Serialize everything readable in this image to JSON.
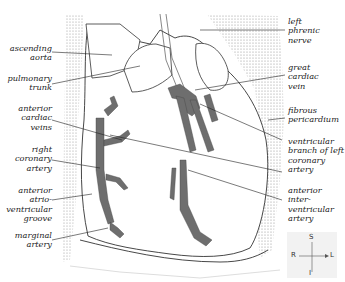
{
  "figure": {
    "labels_left": [
      {
        "id": "ascending-aorta",
        "text": "ascending\naorta",
        "x": 8,
        "y": 44
      },
      {
        "id": "pulmonary-trunk",
        "text": "pulmonary\ntrunk",
        "x": 8,
        "y": 74
      },
      {
        "id": "anterior-cardiac-veins",
        "text": "anterior\ncardiac\nveins",
        "x": 8,
        "y": 104
      },
      {
        "id": "right-coronary-artery",
        "text": "right\ncoronary\nartery",
        "x": 8,
        "y": 145
      },
      {
        "id": "anterior-atrioventricular-groove",
        "text": "anterior\natrio-\nventricular\ngroove",
        "x": 8,
        "y": 186
      },
      {
        "id": "marginal-artery",
        "text": "marginal\nartery",
        "x": 8,
        "y": 231
      }
    ],
    "labels_right": [
      {
        "id": "left-phrenic-nerve",
        "text": "left\nphrenic\nnerve",
        "x": 288,
        "y": 17
      },
      {
        "id": "great-cardiac-vein",
        "text": "great\ncardiac\nvein",
        "x": 288,
        "y": 63
      },
      {
        "id": "fibrous-pericardium",
        "text": "fibrous\npericardium",
        "x": 288,
        "y": 106
      },
      {
        "id": "ventricular-branch-left-coronary-artery",
        "text": "ventricular\nbranch of left\ncoronary\nartery",
        "x": 288,
        "y": 137
      },
      {
        "id": "anterior-interventricular-artery",
        "text": "anterior\ninter-\nventricular\nartery",
        "x": 288,
        "y": 186
      }
    ],
    "orientation": {
      "superior": "S",
      "inferior": "I",
      "right": "R",
      "left": "L"
    },
    "colors": {
      "vessel": "#6e6e6e",
      "line": "#222222",
      "stipple": "#bdbdbd",
      "background": "#ffffff"
    }
  }
}
